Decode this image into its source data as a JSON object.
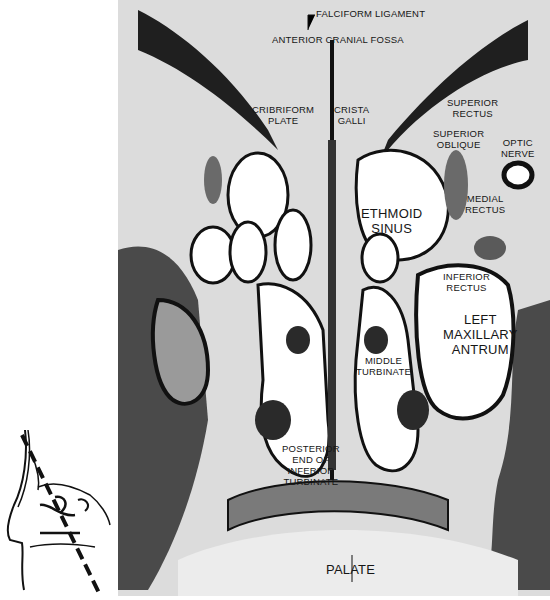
{
  "figure": {
    "type": "coronal histological section of nasal cavity and paranasal sinuses",
    "labels": {
      "falciform_ligament": "FALCIFORM LIGAMENT",
      "anterior_cranial_fossa": "ANTERIOR CRANIAL FOSSA",
      "cribriform_plate": "CRIBRIFORM\nPLATE",
      "crista_galli": "CRISTA\nGALLI",
      "superior_rectus": "SUPERIOR\nRECTUS",
      "superior_oblique": "SUPERIOR\nOBLIQUE",
      "optic_nerve": "OPTIC\nNERVE",
      "medial_rectus": "MEDIAL\nRECTUS",
      "ethmoid_sinus": "ETHMOID\nSINUS",
      "inferior_rectus": "INFERIOR\nRECTUS",
      "left_maxillary_antrum": "LEFT\nMAXILLARY\nANTRUM",
      "middle_turbinate": "MIDDLE\nTURBINATE",
      "posterior_end_inferior_turbinate": "POSTERIOR\nEND OF\nINFERIOR\nTURBINATE",
      "palate": "PALATE"
    },
    "inset": {
      "description": "sagittal outline of head with dashed line indicating plane of section"
    },
    "colors": {
      "background": "#dcdcdc",
      "bone": "#1a1a1a",
      "air_space": "#ffffff",
      "text": "#161616"
    }
  }
}
